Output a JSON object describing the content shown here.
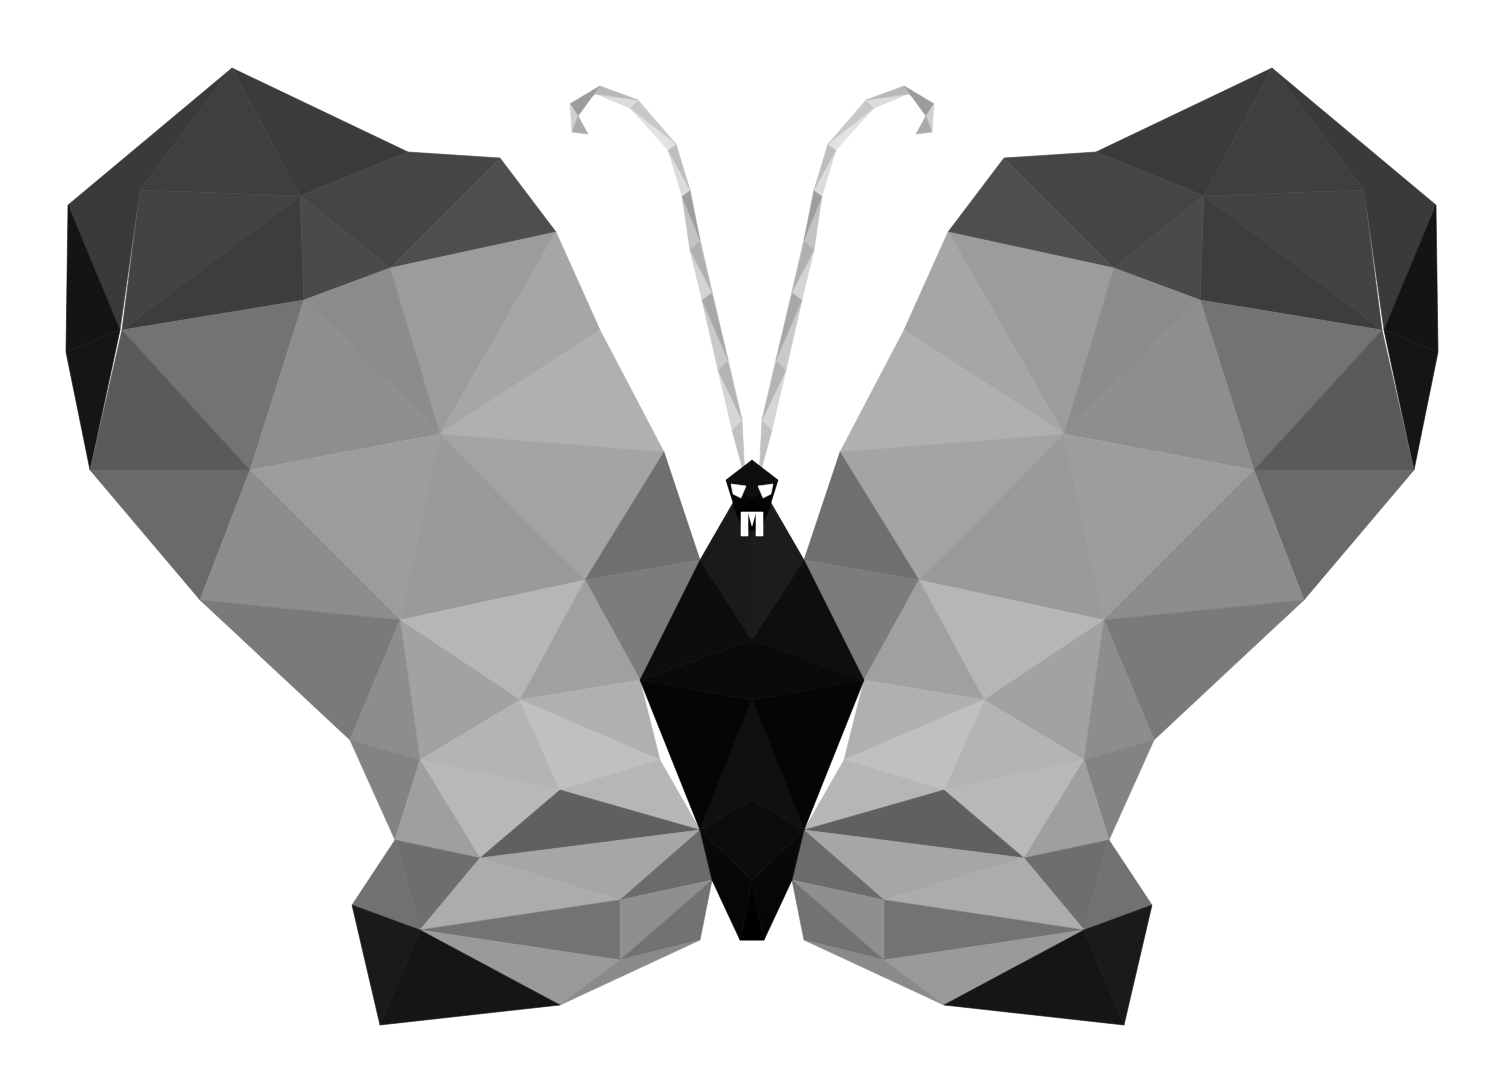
{
  "artwork": {
    "title": "Low Poly Butterfly",
    "subject": "butterfly",
    "style": "low-poly triangulated geometric illustration",
    "palette_name": "grayscale",
    "background_color": "#ffffff",
    "canvas": {
      "width": 1497,
      "height": 1081
    },
    "symmetry": {
      "type": "mirror",
      "axis_x": 752
    }
  },
  "edge_strip": {
    "name": "left-edge-gray-strip",
    "x": 0,
    "y": 0,
    "width": 24,
    "height": 1081,
    "color_top": "#9a9a9a",
    "color_mid": "#8c8c8c",
    "color_bottom": "#a2a2a2",
    "facets": [
      {
        "points": "0,0 24,0 24,210 0,240",
        "fill": "#9d9d9d"
      },
      {
        "points": "0,240 24,210 24,400 0,430",
        "fill": "#8f8f8f"
      },
      {
        "points": "0,430 24,400 24,520 0,560",
        "fill": "#9a9a9a"
      },
      {
        "points": "0,560 24,520 24,700 0,720",
        "fill": "#8a8a8a"
      },
      {
        "points": "0,720 24,700 24,880 0,900",
        "fill": "#969696"
      },
      {
        "points": "0,900 24,880 24,1081 0,1081",
        "fill": "#a0a0a0"
      }
    ]
  },
  "palette": {
    "near_black": "#000000",
    "black_1": "#0c0c0c",
    "black_2": "#141414",
    "very_dark": "#1c1c1c",
    "dark_1": "#2b2b2b",
    "dark_2": "#3a3a3a",
    "dark_3": "#454545",
    "mid_dark_1": "#515151",
    "mid_dark_2": "#5c5c5c",
    "mid_1": "#686868",
    "mid_2": "#737373",
    "mid_3": "#7d7d7d",
    "mid_light_1": "#8a8a8a",
    "mid_light_2": "#949494",
    "light_1": "#9e9e9e",
    "light_2": "#a8a8a8",
    "light_3": "#b2b2b2",
    "light_4": "#bcbcbc",
    "very_light_1": "#c6c6c6",
    "very_light_2": "#d2d2d2",
    "very_light_3": "#dedede",
    "near_white_1": "#e9e9e9",
    "near_white_2": "#f2f2f2",
    "white": "#ffffff"
  },
  "chart_data": {
    "type": "polygon-mosaic",
    "title": "Low Poly Butterfly",
    "regions": [
      "left-forewing",
      "right-forewing",
      "left-hindwing",
      "right-hindwing",
      "thorax",
      "abdomen",
      "head",
      "left-antenna",
      "right-antenna"
    ],
    "facet_count_left_forewing": 26,
    "facet_count_left_hindwing": 18,
    "tone_range": [
      "#000000",
      "#ffffff"
    ]
  },
  "left_forewing": {
    "name": "left-forewing",
    "facets": [
      {
        "points": "232,68 408,152 300,196",
        "fill": "#3b3b3b"
      },
      {
        "points": "232,68 300,196 140,190",
        "fill": "#3f3f3f"
      },
      {
        "points": "140,190 300,196 122,330",
        "fill": "#434343"
      },
      {
        "points": "232,68 140,190 120,330 68,205",
        "fill": "#3a3a3a"
      },
      {
        "points": "120,330 68,205 66,352",
        "fill": "#141414"
      },
      {
        "points": "66,352 120,330 90,470",
        "fill": "#151515"
      },
      {
        "points": "122,330 300,196 304,300",
        "fill": "#3d3d3d"
      },
      {
        "points": "408,152 500,158 390,268 300,196",
        "fill": "#454545"
      },
      {
        "points": "300,196 390,268 304,300",
        "fill": "#4a4a4a"
      },
      {
        "points": "500,158 556,232 390,268",
        "fill": "#4e4e4e"
      },
      {
        "points": "390,268 556,232 440,434",
        "fill": "#9c9c9c"
      },
      {
        "points": "304,300 390,268 440,434",
        "fill": "#8c8c8c"
      },
      {
        "points": "122,330 304,300 250,470",
        "fill": "#737373"
      },
      {
        "points": "304,300 440,434 250,470",
        "fill": "#8e8e8e"
      },
      {
        "points": "122,330 250,470 90,470",
        "fill": "#5a5a5a"
      },
      {
        "points": "90,470 250,470 200,600",
        "fill": "#6a6a6a"
      },
      {
        "points": "250,470 440,434 400,620",
        "fill": "#9d9d9d"
      },
      {
        "points": "250,470 400,620 200,600",
        "fill": "#8d8d8d"
      },
      {
        "points": "556,232 600,330 440,434",
        "fill": "#a6a6a6"
      },
      {
        "points": "600,330 664,452 440,434",
        "fill": "#b0b0b0"
      },
      {
        "points": "440,434 664,452 585,580",
        "fill": "#a4a4a4"
      },
      {
        "points": "440,434 585,580 400,620",
        "fill": "#9a9a9a"
      },
      {
        "points": "585,580 664,452 700,560",
        "fill": "#6f6f6f"
      },
      {
        "points": "400,620 585,580 520,700",
        "fill": "#b6b6b6"
      },
      {
        "points": "585,580 700,560 640,680",
        "fill": "#7c7c7c"
      },
      {
        "points": "585,580 640,680 520,700",
        "fill": "#a0a0a0"
      },
      {
        "points": "200,600 400,620 350,740",
        "fill": "#7a7a7a"
      },
      {
        "points": "400,620 520,700 420,760",
        "fill": "#a2a2a2"
      },
      {
        "points": "400,620 420,760 350,740",
        "fill": "#8d8d8d"
      }
    ]
  },
  "left_hindwing": {
    "name": "left-hindwing",
    "facets": [
      {
        "points": "350,740 420,760 395,840",
        "fill": "#838383"
      },
      {
        "points": "420,760 520,700 560,790",
        "fill": "#b4b4b4"
      },
      {
        "points": "420,760 560,790 480,858",
        "fill": "#b8b8b8"
      },
      {
        "points": "395,840 420,760 480,858",
        "fill": "#9f9f9f"
      },
      {
        "points": "520,700 640,680 660,760",
        "fill": "#b0b0b0"
      },
      {
        "points": "520,700 660,760 560,790",
        "fill": "#c0c0c0"
      },
      {
        "points": "560,790 660,760 700,830",
        "fill": "#b6b6b6"
      },
      {
        "points": "480,858 560,790 700,830",
        "fill": "#606060"
      },
      {
        "points": "480,858 700,830 620,900",
        "fill": "#a6a6a6"
      },
      {
        "points": "395,840 480,858 420,930",
        "fill": "#6e6e6e"
      },
      {
        "points": "420,930 480,858 620,900",
        "fill": "#acacac"
      },
      {
        "points": "420,930 620,900 620,960",
        "fill": "#737373"
      },
      {
        "points": "395,840 420,930 352,905",
        "fill": "#717171"
      },
      {
        "points": "352,905 420,930 380,1025",
        "fill": "#1a1a1a"
      },
      {
        "points": "420,930 620,960 560,1005",
        "fill": "#9a9a9a"
      },
      {
        "points": "380,1025 420,930 560,1005",
        "fill": "#151515"
      },
      {
        "points": "620,900 700,830 712,880",
        "fill": "#6b6b6b"
      },
      {
        "points": "620,900 712,880 620,960",
        "fill": "#8f8f8f"
      },
      {
        "points": "620,960 712,880 700,940",
        "fill": "#727272"
      },
      {
        "points": "560,1005 620,960 700,940",
        "fill": "#8a8a8a"
      }
    ]
  },
  "thorax": {
    "name": "thorax-and-body",
    "facets": [
      {
        "points": "700,560 752,470 752,640",
        "fill": "#1a1a1a"
      },
      {
        "points": "752,470 804,560 752,640",
        "fill": "#1c1c1c"
      },
      {
        "points": "640,680 700,560 752,640",
        "fill": "#0d0d0d"
      },
      {
        "points": "752,640 804,560 864,680",
        "fill": "#0e0e0e"
      },
      {
        "points": "640,680 752,640 752,700",
        "fill": "#0a0a0a"
      },
      {
        "points": "752,640 864,680 752,700",
        "fill": "#0a0a0a"
      },
      {
        "points": "700,830 752,700 752,800",
        "fill": "#101010"
      },
      {
        "points": "752,700 804,830 752,800",
        "fill": "#101010"
      },
      {
        "points": "640,680 752,700 700,830",
        "fill": "#050505"
      },
      {
        "points": "752,700 864,680 804,830",
        "fill": "#050505"
      },
      {
        "points": "700,830 752,800 752,880",
        "fill": "#0c0c0c"
      },
      {
        "points": "752,800 804,830 752,880",
        "fill": "#0c0c0c"
      },
      {
        "points": "712,880 700,830 752,880",
        "fill": "#080808"
      },
      {
        "points": "752,880 804,830 792,880",
        "fill": "#080808"
      },
      {
        "points": "712,880 752,880 740,940",
        "fill": "#060606"
      },
      {
        "points": "752,880 792,880 764,940",
        "fill": "#060606"
      },
      {
        "points": "740,940 752,880 764,940",
        "fill": "#030303"
      },
      {
        "points": "740,940 764,940 752,910",
        "fill": "#000000"
      }
    ]
  },
  "head": {
    "name": "head-and-neck",
    "facets": [
      {
        "points": "726,480 752,460 752,500",
        "fill": "#0e0e0e"
      },
      {
        "points": "752,460 778,480 752,500",
        "fill": "#0e0e0e"
      },
      {
        "points": "726,480 752,500 736,512",
        "fill": "#050505"
      },
      {
        "points": "752,500 778,480 768,512",
        "fill": "#050505"
      },
      {
        "points": "736,512 752,500 752,530 744,530",
        "fill": "#000000"
      },
      {
        "points": "752,500 768,512 760,530 752,530",
        "fill": "#000000"
      }
    ],
    "markings": [
      {
        "name": "white-collar-left",
        "points": "731,484 746,486 741,498 733,494",
        "fill": "#ffffff"
      },
      {
        "name": "white-collar-right",
        "points": "773,484 758,486 763,498 771,494",
        "fill": "#ffffff"
      },
      {
        "name": "white-m-mark-left",
        "points": "741,512 748,512 748,536 741,536",
        "fill": "#ffffff"
      },
      {
        "name": "white-m-mark-right",
        "points": "756,512 763,512 763,536 756,536",
        "fill": "#ffffff"
      },
      {
        "name": "white-m-mark-center",
        "points": "748,512 756,512 752,526",
        "fill": "#ffffff"
      }
    ]
  },
  "left_antenna": {
    "name": "left-antenna",
    "facets": [
      {
        "points": "745,478 732,430 742,420",
        "fill": "#c0c0c0"
      },
      {
        "points": "732,430 742,420 718,370",
        "fill": "#d6d6d6"
      },
      {
        "points": "742,420 728,360 718,370",
        "fill": "#b4b4b4"
      },
      {
        "points": "718,370 728,360 702,300",
        "fill": "#cacaca"
      },
      {
        "points": "728,360 712,292 702,300",
        "fill": "#a8a8a8"
      },
      {
        "points": "702,300 712,292 690,250",
        "fill": "#d4d4d4"
      },
      {
        "points": "712,292 700,240 690,250",
        "fill": "#b0b0b0"
      },
      {
        "points": "690,250 700,240 682,196",
        "fill": "#c2c2c2"
      },
      {
        "points": "700,240 690,190 682,196",
        "fill": "#9e9e9e"
      },
      {
        "points": "682,196 690,190 668,150",
        "fill": "#dcdcdc"
      },
      {
        "points": "690,190 676,144 668,150",
        "fill": "#bebebe"
      },
      {
        "points": "668,150 676,144 630,108",
        "fill": "#e2e2e2"
      },
      {
        "points": "676,144 638,100 630,108",
        "fill": "#c8c8c8"
      },
      {
        "points": "630,108 638,100 596,94",
        "fill": "#dcdcdc"
      },
      {
        "points": "638,100 600,86 596,94",
        "fill": "#b8b8b8"
      },
      {
        "points": "596,94 600,86 570,104",
        "fill": "#c4c4c4"
      },
      {
        "points": "600,86 578,116 570,104",
        "fill": "#9c9c9c"
      },
      {
        "points": "570,104 578,116 572,132",
        "fill": "#d0d0d0"
      },
      {
        "points": "578,116 588,134 572,132",
        "fill": "#aaaaaa"
      }
    ]
  },
  "right_forewing": {
    "name": "right-forewing",
    "mirror_of": "left_forewing"
  },
  "right_hindwing": {
    "name": "right-hindwing",
    "mirror_of": "left_hindwing"
  },
  "right_antenna": {
    "name": "right-antenna",
    "mirror_of": "left_antenna"
  }
}
